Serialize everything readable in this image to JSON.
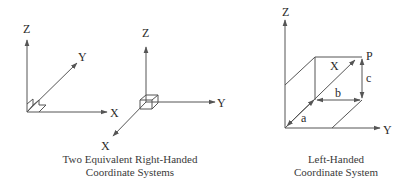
{
  "diagram": {
    "right_handed_1": {
      "z_label": "Z",
      "y_label": "Y",
      "x_label": "X"
    },
    "right_handed_2": {
      "z_label": "Z",
      "y_label": "Y",
      "x_label": "X"
    },
    "left_handed": {
      "z_label": "Z",
      "y_label": "Y",
      "x_label": "X",
      "point_label": "P",
      "a_label": "a",
      "b_label": "b",
      "c_label": "c"
    },
    "captions": {
      "right_handed": {
        "line1": "Two Equivalent Right-Handed",
        "line2": "Coordinate Systems"
      },
      "left_handed": {
        "line1": "Left-Handed",
        "line2": "Coordinate System"
      }
    },
    "colors": {
      "line": "#555555",
      "text": "#2a2a2a"
    }
  }
}
